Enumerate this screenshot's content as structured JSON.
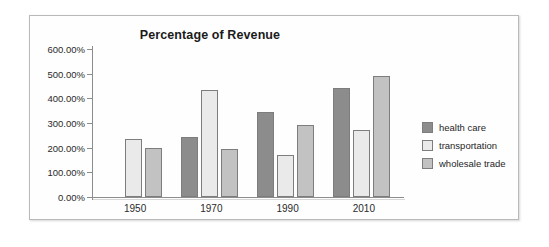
{
  "chart_data": {
    "type": "bar",
    "title": "Percentage of Revenue",
    "xlabel": "",
    "ylabel": "",
    "ylim": [
      0,
      600
    ],
    "grid": false,
    "legend_position": "right",
    "categories": [
      "1950",
      "1970",
      "1990",
      "2010"
    ],
    "ytick_labels": [
      "600.00%",
      "500.00%",
      "400.00%",
      "300.00%",
      "200.00%",
      "100.00%",
      "0.00%"
    ],
    "ytick_values": [
      600,
      500,
      400,
      300,
      200,
      100,
      0
    ],
    "series": [
      {
        "name": "health care",
        "color": "#8c8c8c",
        "values": [
          null,
          245,
          343,
          440
        ]
      },
      {
        "name": "transportation",
        "color": "#eaeaea",
        "values": [
          237,
          435,
          172,
          270
        ]
      },
      {
        "name": "wholesale trade",
        "color": "#c2c2c2",
        "values": [
          197,
          193,
          292,
          490
        ]
      }
    ]
  }
}
